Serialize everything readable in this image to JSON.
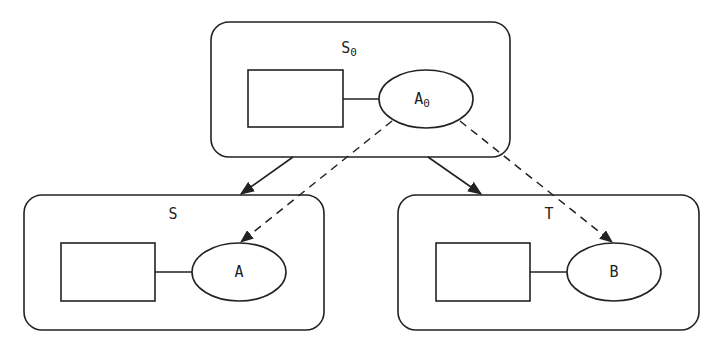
{
  "diagram": {
    "nodes": {
      "top": {
        "label": "S",
        "subscript": "0",
        "ellipse_label": "A",
        "ellipse_subscript": "0"
      },
      "left": {
        "label": "S",
        "ellipse_label": "A"
      },
      "right": {
        "label": "T",
        "ellipse_label": "B"
      }
    },
    "edges": [
      {
        "from": "S0",
        "to": "S",
        "style": "solid"
      },
      {
        "from": "S0",
        "to": "T",
        "style": "solid"
      },
      {
        "from": "A0",
        "to": "A",
        "style": "dashed"
      },
      {
        "from": "A0",
        "to": "B",
        "style": "dashed"
      }
    ],
    "colors": {
      "stroke": "#222222",
      "background": "#ffffff"
    }
  }
}
